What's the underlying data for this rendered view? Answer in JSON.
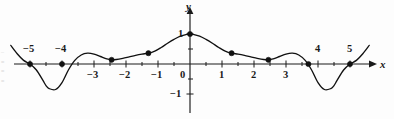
{
  "figure": {
    "background_color": "#fdfdfd",
    "ink_color": "#111111",
    "width": 394,
    "height": 119
  },
  "axes": {
    "x_axis_label": "x",
    "y_axis_label": "y",
    "origin_label": "0",
    "x_tick_labels": [
      {
        "text": "−5",
        "value": -5
      },
      {
        "text": "−4",
        "value": -4
      },
      {
        "text": "−3",
        "value": -3
      },
      {
        "text": "−2",
        "value": -2
      },
      {
        "text": "−1",
        "value": -1
      },
      {
        "text": "1",
        "value": 1
      },
      {
        "text": "2",
        "value": 2
      },
      {
        "text": "3",
        "value": 3
      },
      {
        "text": "4",
        "value": 4
      },
      {
        "text": "5",
        "value": 5
      }
    ],
    "y_tick_labels": [
      {
        "text": "1",
        "value": 1
      },
      {
        "text": "−1",
        "value": -1
      }
    ]
  },
  "edge_artifacts": {
    "left_margin_marks": "–\n≡\n≡\n≡"
  },
  "chart_data": {
    "type": "line",
    "title": "",
    "subtitle": "",
    "xlabel": "x",
    "ylabel": "y",
    "xlim": [
      -5.6,
      5.8
    ],
    "ylim": [
      -1.35,
      1.35
    ],
    "grid": false,
    "legend": null,
    "x_ticks": [
      -5,
      -4,
      -3,
      -2,
      -1,
      0,
      1,
      2,
      3,
      4,
      5
    ],
    "y_ticks": [
      -1,
      1
    ],
    "x_tick_labels_shown": [
      "−5",
      "−4",
      "−3",
      "−2",
      "−1",
      "0",
      "1",
      "2",
      "3",
      "4",
      "5"
    ],
    "y_tick_labels_shown": [
      "1",
      "−1"
    ],
    "series": [
      {
        "name": "curve",
        "description": "Oscillating curve, even-symmetric about the y-axis, peaking at (0, 1) with deep troughs near x = ±4.5 reaching about −1.",
        "x": [
          -5.6,
          -5.4,
          -5.2,
          -5.0,
          -4.8,
          -4.6,
          -4.5,
          -4.4,
          -4.2,
          -4.0,
          -3.8,
          -3.6,
          -3.4,
          -3.2,
          -3.0,
          -2.8,
          -2.6,
          -2.45,
          -2.3,
          -2.1,
          -1.9,
          -1.7,
          -1.5,
          -1.3,
          -1.1,
          -0.9,
          -0.7,
          -0.5,
          -0.3,
          -0.1,
          0.0,
          0.1,
          0.3,
          0.5,
          0.7,
          0.9,
          1.1,
          1.3,
          1.5,
          1.7,
          1.9,
          2.1,
          2.3,
          2.45,
          2.6,
          2.8,
          3.0,
          3.2,
          3.4,
          3.6,
          3.8,
          4.0,
          4.2,
          4.4,
          4.5,
          4.6,
          4.8,
          5.0,
          5.2,
          5.4,
          5.6
        ],
        "y": [
          0.62,
          0.34,
          0.12,
          0.0,
          -0.2,
          -0.54,
          -0.72,
          -0.82,
          -0.85,
          -0.62,
          -0.2,
          0.12,
          0.3,
          0.36,
          0.33,
          0.25,
          0.17,
          0.14,
          0.15,
          0.19,
          0.24,
          0.29,
          0.33,
          0.36,
          0.43,
          0.55,
          0.69,
          0.82,
          0.93,
          0.99,
          1.0,
          0.99,
          0.93,
          0.82,
          0.69,
          0.55,
          0.43,
          0.36,
          0.33,
          0.29,
          0.24,
          0.19,
          0.15,
          0.14,
          0.17,
          0.25,
          0.33,
          0.36,
          0.3,
          0.12,
          -0.2,
          -0.62,
          -0.85,
          -0.82,
          -0.72,
          -0.54,
          -0.2,
          0.0,
          0.12,
          0.34,
          0.62
        ]
      }
    ],
    "marked_points": [
      {
        "x": -5.0,
        "y": 0.0,
        "label": ""
      },
      {
        "x": -4.0,
        "y": 0.0,
        "label": ""
      },
      {
        "x": -2.45,
        "y": 0.14,
        "label": ""
      },
      {
        "x": -1.3,
        "y": 0.36,
        "label": ""
      },
      {
        "x": 0.0,
        "y": 1.0,
        "label": ""
      },
      {
        "x": 1.3,
        "y": 0.36,
        "label": ""
      },
      {
        "x": 2.45,
        "y": 0.14,
        "label": ""
      },
      {
        "x": 3.7,
        "y": 0.0,
        "label": ""
      },
      {
        "x": 5.0,
        "y": 0.0,
        "label": ""
      }
    ]
  }
}
